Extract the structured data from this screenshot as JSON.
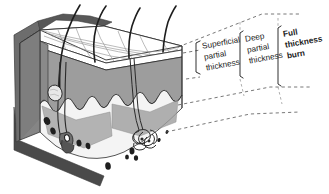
{
  "diagram": {
    "type": "anatomical-block-diagram",
    "background_color": "#ffffff",
    "labels": [
      {
        "id": "superficial-partial-thickness",
        "lines": [
          "Superficial",
          "partial",
          "thickness"
        ],
        "bold": false,
        "bracket": "left"
      },
      {
        "id": "deep-partial-thickness",
        "lines": [
          "Deep",
          "partial",
          "thickness"
        ],
        "bold": false,
        "bracket": "left"
      },
      {
        "id": "full-thickness-burn",
        "lines": [
          "Full",
          "thickness",
          "burn"
        ],
        "bold": true,
        "bracket": "left"
      }
    ],
    "anatomy": {
      "layers": [
        {
          "name": "epidermis",
          "color": "#ffffff"
        },
        {
          "name": "dermis",
          "color": "#9d9d9d"
        },
        {
          "name": "subcutaneous-fat",
          "color": "#f2f2f2"
        },
        {
          "name": "back-wall",
          "color": "#6d6d6d"
        },
        {
          "name": "shadow",
          "color": "#4a4a4a"
        }
      ],
      "structures": [
        {
          "name": "hair-shaft",
          "count": 4
        },
        {
          "name": "hair-follicle",
          "count": 2
        },
        {
          "name": "sebaceous-gland",
          "count": 1
        },
        {
          "name": "sweat-gland",
          "count": 1
        },
        {
          "name": "fat-cell",
          "count": 11
        },
        {
          "name": "skin-surface-texture",
          "count": 1
        }
      ]
    },
    "colors": {
      "ink": "#1a1a1a",
      "dermis": "#9d9d9d",
      "epidermis": "#ffffff",
      "subcutaneous": "#f2f2f2",
      "back_wall": "#6d6d6d",
      "shadow": "#4a4a4a",
      "leader_line": "#555555"
    }
  }
}
